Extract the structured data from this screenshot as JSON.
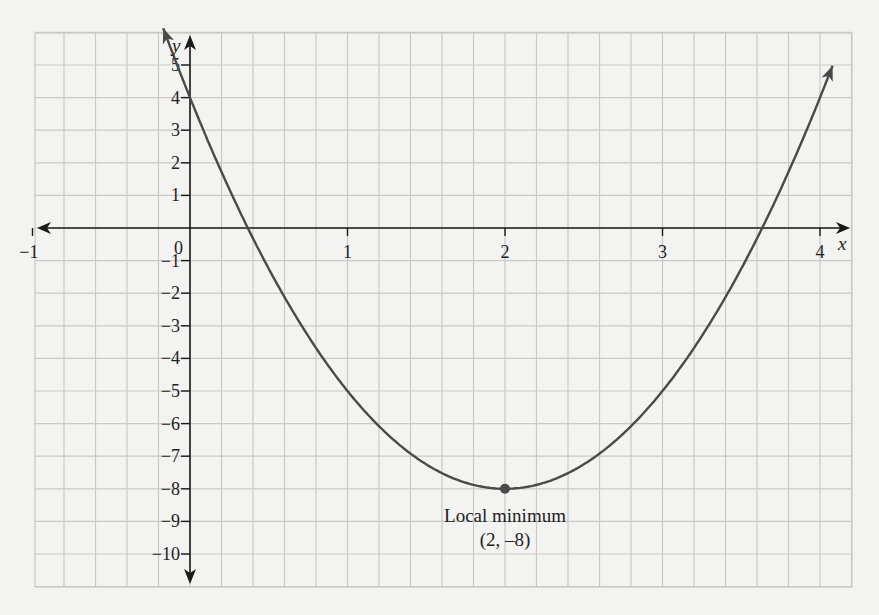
{
  "chart_data": {
    "type": "line",
    "title": "",
    "function": "y = 3(x - 2)^2 - 8",
    "xlabel": "x",
    "ylabel": "y",
    "xlim": [
      -1.2,
      4.2
    ],
    "ylim": [
      -11,
      6
    ],
    "grid": true,
    "x_ticks": [
      -1,
      1,
      2,
      3,
      4
    ],
    "x_tick_labels": [
      "−1",
      "1",
      "2",
      "3",
      "4"
    ],
    "y_ticks": [
      5,
      4,
      3,
      2,
      1,
      -1,
      -2,
      -3,
      -4,
      -5,
      -6,
      -7,
      -8,
      -9,
      -10
    ],
    "y_tick_labels": [
      "5",
      "4",
      "3",
      "2",
      "1",
      "−1",
      "−2",
      "−3",
      "−4",
      "−5",
      "−6",
      "−7",
      "−8",
      "−9",
      "−10"
    ],
    "origin_label": "0",
    "series": [
      {
        "name": "curve",
        "x": [
          -0.2,
          0,
          0.367,
          0.5,
          1,
          1.5,
          2,
          2.5,
          3,
          3.5,
          3.633,
          4,
          4.12
        ],
        "y": [
          6.52,
          4,
          0,
          -1.25,
          -5,
          -7.25,
          -8,
          -7.25,
          -5,
          -1.25,
          0,
          4,
          5.48
        ]
      }
    ],
    "annotations": [
      {
        "point": [
          2,
          -8
        ],
        "label_line1": "Local minimum",
        "label_line2": "(2, –8)"
      }
    ]
  },
  "colors": {
    "background": "#f3f3f1",
    "grid": "#c9c9c9",
    "axis": "#1a1a1a",
    "curve": "#4a4a4a"
  }
}
